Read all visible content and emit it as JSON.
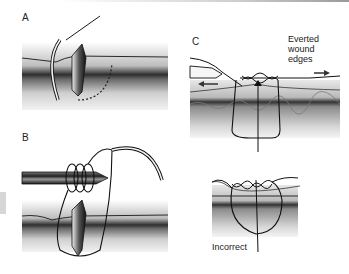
{
  "figure": {
    "panels": [
      {
        "id": "A",
        "label": "A",
        "description": "Needle entering skin perpendicular, curved path beneath wound"
      },
      {
        "id": "B",
        "label": "B",
        "description": "Needle holder with suture wrapped around it to form knot"
      },
      {
        "id": "C",
        "label": "C",
        "description": "Correctly tied knot with everted wound edges"
      },
      {
        "id": "D",
        "label": "",
        "description": "Incorrectly tied suture (inverted edges)"
      }
    ],
    "annotations": {
      "everted_line1": "Everted",
      "everted_line2": "wound",
      "everted_line3": "edges",
      "incorrect": "Incorrect"
    },
    "colors": {
      "line": "#1a1a1a",
      "skin_dark": "#3a3a3a",
      "skin_light": "#d9d9d9",
      "background": "#ffffff"
    }
  }
}
